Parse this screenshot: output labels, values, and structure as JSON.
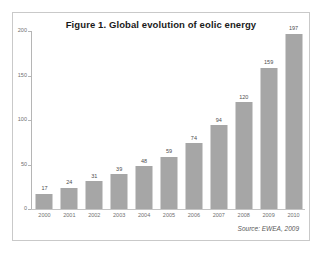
{
  "figure": {
    "title": "Figure 1. Global evolution of eolic energy",
    "source_note": "Source: EWEA, 2009"
  },
  "colors": {
    "bar_fill": "#a6a6a6",
    "frame_border": "#c9c9c9",
    "axis_line": "#b5b5b5",
    "title_text": "#1a1a1a",
    "tick_text": "#6f6f6f",
    "value_text": "#4d4d4d",
    "background": "#ffffff"
  },
  "chart_data": {
    "type": "bar",
    "title": "Figure 1. Global evolution of eolic energy",
    "xlabel": "",
    "ylabel": "",
    "categories": [
      "2000",
      "2001",
      "2002",
      "2003",
      "2004",
      "2005",
      "2006",
      "2007",
      "2008",
      "2009",
      "2010"
    ],
    "values": [
      17,
      24,
      31,
      39,
      48,
      59,
      74,
      94,
      120,
      159,
      197
    ],
    "value_labels": [
      "17",
      "24",
      "31",
      "39",
      "48",
      "59",
      "74",
      "94",
      "120",
      "159",
      "197"
    ],
    "ylim": [
      0,
      200
    ],
    "yticks": [
      0,
      50,
      100,
      150,
      200
    ],
    "ytick_labels": [
      "0",
      "50",
      "100",
      "150",
      "200"
    ],
    "grid": false,
    "legend": null,
    "annotations": [
      "Source: EWEA, 2009"
    ]
  }
}
